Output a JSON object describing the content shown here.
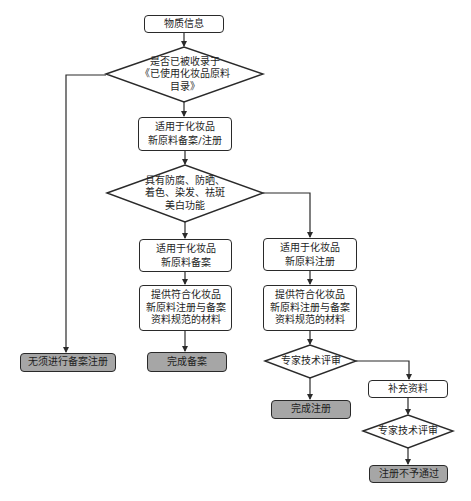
{
  "flowchart": {
    "nodes": {
      "substance_info": {
        "type": "process",
        "lines": [
          "物质信息"
        ]
      },
      "in_catalog_check": {
        "type": "decision",
        "lines": [
          "是否已被收录于",
          "《已使用化妆品原料",
          "目录》"
        ]
      },
      "applicable_record_register": {
        "type": "process",
        "lines": [
          "适用于化妆品",
          "新原料备案/注册"
        ]
      },
      "function_check": {
        "type": "decision",
        "lines": [
          "具有防腐、防晒、",
          "着色、染发、祛斑",
          "美白功能"
        ]
      },
      "applicable_record": {
        "type": "process",
        "lines": [
          "适用于化妆品",
          "新原料备案"
        ]
      },
      "applicable_register": {
        "type": "process",
        "lines": [
          "适用于化妆品",
          "新原料注册"
        ]
      },
      "materials_record": {
        "type": "process",
        "lines": [
          "提供符合化妆品",
          "新原料注册与备案",
          "资料规范的材料"
        ]
      },
      "materials_register": {
        "type": "process",
        "lines": [
          "提供符合化妆品",
          "新原料注册与备案",
          "资料规范的材料"
        ]
      },
      "no_need": {
        "type": "terminal",
        "lines": [
          "无须进行备案注册"
        ]
      },
      "record_complete": {
        "type": "terminal",
        "lines": [
          "完成备案"
        ]
      },
      "expert_review_1": {
        "type": "decision",
        "lines": [
          "专家技术评审"
        ]
      },
      "register_complete": {
        "type": "terminal",
        "lines": [
          "完成注册"
        ]
      },
      "supplement": {
        "type": "process",
        "lines": [
          "补充资料"
        ]
      },
      "expert_review_2": {
        "type": "decision",
        "lines": [
          "专家技术评审"
        ]
      },
      "register_rejected": {
        "type": "terminal",
        "lines": [
          "注册不予通过"
        ]
      }
    },
    "edges": [
      {
        "from": "substance_info",
        "to": "in_catalog_check"
      },
      {
        "from": "in_catalog_check",
        "to": "applicable_record_register"
      },
      {
        "from": "in_catalog_check",
        "to": "no_need"
      },
      {
        "from": "applicable_record_register",
        "to": "function_check"
      },
      {
        "from": "function_check",
        "to": "applicable_record"
      },
      {
        "from": "function_check",
        "to": "applicable_register"
      },
      {
        "from": "applicable_record",
        "to": "materials_record"
      },
      {
        "from": "applicable_register",
        "to": "materials_register"
      },
      {
        "from": "materials_record",
        "to": "record_complete"
      },
      {
        "from": "materials_register",
        "to": "expert_review_1"
      },
      {
        "from": "expert_review_1",
        "to": "register_complete"
      },
      {
        "from": "expert_review_1",
        "to": "supplement"
      },
      {
        "from": "supplement",
        "to": "expert_review_2"
      },
      {
        "from": "expert_review_2",
        "to": "register_rejected"
      }
    ],
    "colors": {
      "border": "#2a2a2a",
      "terminal_fill": "#a6a6a6",
      "process_fill": "#ffffff",
      "text": "#1e1e1e"
    }
  }
}
